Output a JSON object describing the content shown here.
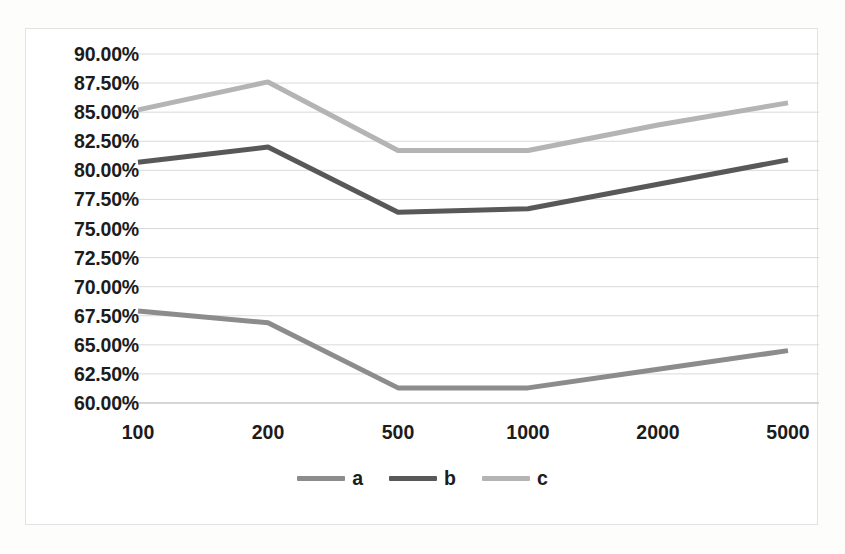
{
  "chart_data": {
    "type": "line",
    "title": "",
    "subtitle": "",
    "xlabel": "",
    "ylabel": "",
    "categories": [
      "100",
      "200",
      "500",
      "1000",
      "2000",
      "5000"
    ],
    "series": [
      {
        "name": "a",
        "color": "#8c8c8c",
        "values": [
          67.9,
          66.9,
          61.3,
          61.3,
          62.9,
          64.5
        ]
      },
      {
        "name": "b",
        "color": "#585858",
        "values": [
          80.7,
          82.0,
          76.4,
          76.7,
          78.8,
          80.9
        ]
      },
      {
        "name": "c",
        "color": "#b4b4b4",
        "values": [
          85.2,
          87.6,
          81.7,
          81.7,
          83.9,
          85.8
        ]
      }
    ],
    "ylim": [
      60.0,
      90.0
    ],
    "ytick_step": 2.5,
    "ytick_labels": [
      "90.00%",
      "87.50%",
      "85.00%",
      "82.50%",
      "80.00%",
      "77.50%",
      "75.00%",
      "72.50%",
      "70.00%",
      "67.50%",
      "65.00%",
      "62.50%",
      "60.00%"
    ],
    "ytick_values": [
      90.0,
      87.5,
      85.0,
      82.5,
      80.0,
      77.5,
      75.0,
      72.5,
      70.0,
      67.5,
      65.0,
      62.5,
      60.0
    ],
    "value_suffix": "%",
    "grid": true,
    "grid_axis": "y",
    "grid_color": "#d9d9d9",
    "legend_position": "bottom",
    "legend_entries": [
      "a",
      "b",
      "c"
    ],
    "axis_line_color": "#bfbfbf",
    "plot_background": "#ffffff"
  }
}
